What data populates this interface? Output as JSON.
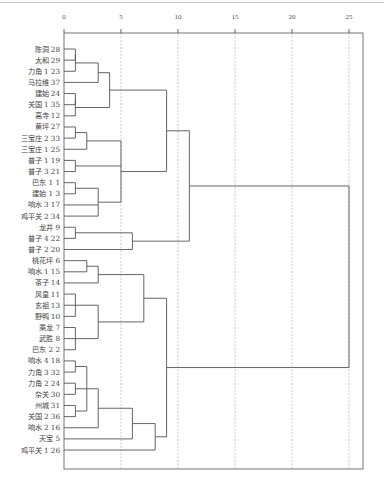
{
  "chart_data": {
    "type": "dendrogram",
    "title": "",
    "xlabel": "",
    "ylabel": "",
    "xlim": [
      0,
      25
    ],
    "x_ticks": [
      "0",
      "5",
      "10",
      "15",
      "20",
      "25"
    ],
    "grid": "vertical dashed at each tick",
    "leaves": [
      "陈洞 28",
      "太和 29",
      "力角 1 23",
      "马拉维 37",
      "建始 24",
      "关国 1 35",
      "高寺 12",
      "黄坪 27",
      "三宝庄 2 33",
      "三宝庄 1 25",
      "普子 1 19",
      "普子 3 21",
      "巴东 1 1",
      "建始 1 3",
      "响水 3 17",
      "鸡平关 2 34",
      "龙井 9",
      "普子 4 22",
      "普子 2 20",
      "桃花坪 6",
      "响水 1 15",
      "茶子 14",
      "风皇 11",
      "玄祖 13",
      "野鸭 10",
      "乘龙 7",
      "武胜 8",
      "巴东 2 2",
      "响水 4 18",
      "力角 3 32",
      "力角 2 24",
      "杂关 30",
      "州城 31",
      "关国 2 36",
      "响水 2 16",
      "天宝 5",
      "鸡平关 1 26"
    ],
    "merges_approx_distance": [
      {
        "clade": [
          "陈洞 28",
          "太和 29",
          "力角 1 23"
        ],
        "distance": 1.0
      },
      {
        "clade": [
          "陈洞 28..马拉维 37"
        ],
        "distance": 3.0
      },
      {
        "clade": [
          "建始 24",
          "关国 1 35",
          "高寺 12"
        ],
        "distance": 1.0
      },
      {
        "clade": [
          "陈洞 28..高寺 12"
        ],
        "distance": 4.0
      },
      {
        "clade": [
          "黄坪 27",
          "三宝庄 2 33"
        ],
        "distance": 1.0
      },
      {
        "clade": [
          "黄坪 27..三宝庄 1 25"
        ],
        "distance": 2.0
      },
      {
        "clade": [
          "普子 1 19",
          "普子 3 21"
        ],
        "distance": 1.0
      },
      {
        "clade": [
          "巴东 1 1",
          "建始 1 3"
        ],
        "distance": 1.0
      },
      {
        "clade": [
          "巴东 1 1..鸡平关 2 34"
        ],
        "distance": 2.0
      },
      {
        "clade": [
          "黄坪 27..鸡平关 2 34"
        ],
        "distance": 5.0
      },
      {
        "clade": [
          "陈洞 28..鸡平关 2 34"
        ],
        "distance": 9.0
      },
      {
        "clade": [
          "龙井 9",
          "普子 4 22"
        ],
        "distance": 1.0
      },
      {
        "clade": [
          "龙井 9..普子 2 20"
        ],
        "distance": 6.0
      },
      {
        "clade": [
          "陈洞 28..普子 2 20"
        ],
        "distance": 11.0
      },
      {
        "clade": [
          "桃花坪 6",
          "响水 1 15"
        ],
        "distance": 2.0
      },
      {
        "clade": [
          "桃花坪 6..茶子 14"
        ],
        "distance": 3.0
      },
      {
        "clade": [
          "风皇 11",
          "玄祖 13",
          "野鸭 10"
        ],
        "distance": 1.0
      },
      {
        "clade": [
          "乘龙 7",
          "武胜 8",
          "巴东 2 2"
        ],
        "distance": 1.0
      },
      {
        "clade": [
          "风皇 11..巴东 2 2"
        ],
        "distance": 3.0
      },
      {
        "clade": [
          "桃花坪 6..巴东 2 2"
        ],
        "distance": 7.0
      },
      {
        "clade": [
          "响水 4 18",
          "力角 3 32"
        ],
        "distance": 1.0
      },
      {
        "clade": [
          "力角 2 24",
          "杂关 30"
        ],
        "distance": 1.0
      },
      {
        "clade": [
          "州城 31",
          "关国 2 36"
        ],
        "distance": 1.0
      },
      {
        "clade": [
          "响水 4 18..关国 2 36"
        ],
        "distance": 2.0
      },
      {
        "clade": [
          "响水 4 18..响水 2 16"
        ],
        "distance": 3.0
      },
      {
        "clade": [
          "响水 4 18..天宝 5"
        ],
        "distance": 6.0
      },
      {
        "clade": [
          "响水 4 18..鸡平关 1 26"
        ],
        "distance": 8.0
      },
      {
        "clade": [
          "桃花坪 6..鸡平关 1 26"
        ],
        "distance": 9.0
      },
      {
        "clade": [
          "all"
        ],
        "distance": 25.0
      }
    ]
  },
  "axis": {
    "ticks": [
      {
        "label": "0",
        "value": 0
      },
      {
        "label": "5",
        "value": 5
      },
      {
        "label": "10",
        "value": 10
      },
      {
        "label": "15",
        "value": 15
      },
      {
        "label": "20",
        "value": 20
      },
      {
        "label": "25",
        "value": 25
      }
    ]
  }
}
